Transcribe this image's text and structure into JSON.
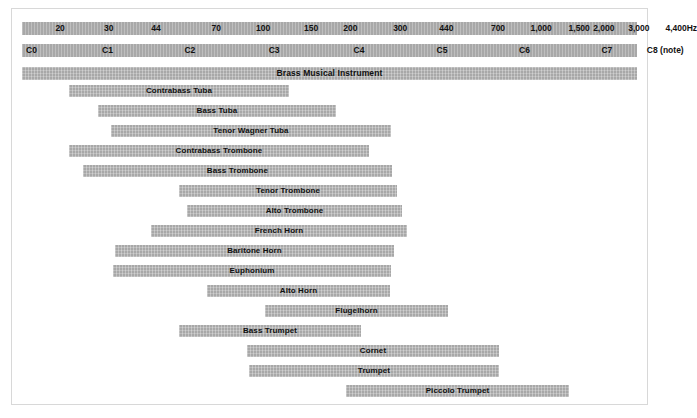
{
  "chart_data": {
    "type": "bar",
    "title": "Brass Musical Instrument",
    "subtitle": "",
    "xlabel": "",
    "ylabel": "",
    "orientation": "horizontal-range",
    "grid": false,
    "legend": "none",
    "axes": [
      {
        "name": "frequency-axis",
        "unit": "Hz",
        "scale": "logarithmic",
        "ticks": [
          {
            "label": "20",
            "x_pct": 6.2
          },
          {
            "label": "30",
            "x_pct": 14.1
          },
          {
            "label": "44",
            "x_pct": 21.8
          },
          {
            "label": "70",
            "x_pct": 31.6
          },
          {
            "label": "100",
            "x_pct": 39.2
          },
          {
            "label": "150",
            "x_pct": 47.0
          },
          {
            "label": "200",
            "x_pct": 53.4
          },
          {
            "label": "300",
            "x_pct": 61.5
          },
          {
            "label": "440",
            "x_pct": 69.0
          },
          {
            "label": "700",
            "x_pct": 77.4
          },
          {
            "label": "1,000",
            "x_pct": 84.4
          },
          {
            "label": "1,500",
            "x_pct": 90.6
          },
          {
            "label": "2,000",
            "x_pct": 94.6
          },
          {
            "label": "3,000",
            "x_pct": 100.3
          },
          {
            "label": "4,400Hz",
            "x_pct": 107.2
          }
        ]
      },
      {
        "name": "note-axis",
        "unit": "note",
        "scale": "logarithmic",
        "ticks": [
          {
            "label": "C0",
            "x_pct": 0.6,
            "anchor": "left"
          },
          {
            "label": "C1",
            "x_pct": 13.9
          },
          {
            "label": "C2",
            "x_pct": 27.3
          },
          {
            "label": "C3",
            "x_pct": 41.0
          },
          {
            "label": "C4",
            "x_pct": 54.8
          },
          {
            "label": "C5",
            "x_pct": 68.3
          },
          {
            "label": "C6",
            "x_pct": 81.7
          },
          {
            "label": "C7",
            "x_pct": 95.1
          },
          {
            "label": "C8 (note)",
            "x_pct": 104.6
          }
        ]
      }
    ],
    "master_band": {
      "label": "Brass Musical Instrument",
      "start_pct": 0,
      "end_pct": 100
    },
    "instruments": [
      {
        "name": "Contrabass Tuba",
        "start_px": 68,
        "end_px": 288
      },
      {
        "name": "Bass Tuba",
        "start_px": 97,
        "end_px": 335
      },
      {
        "name": "Tenor Wagner Tuba",
        "start_px": 110,
        "end_px": 390
      },
      {
        "name": "Contrabass Trombone",
        "start_px": 68,
        "end_px": 368
      },
      {
        "name": "Bass Trombone",
        "start_px": 82,
        "end_px": 391
      },
      {
        "name": "Tenor Trombone",
        "start_px": 178,
        "end_px": 396
      },
      {
        "name": "Alto Trombone",
        "start_px": 186,
        "end_px": 401
      },
      {
        "name": "French Horn",
        "start_px": 150,
        "end_px": 406
      },
      {
        "name": "Baritone Horn",
        "start_px": 114,
        "end_px": 393
      },
      {
        "name": "Euphonium",
        "start_px": 112,
        "end_px": 390
      },
      {
        "name": "Alto Horn",
        "start_px": 206,
        "end_px": 389
      },
      {
        "name": "Flugelhorn",
        "start_px": 264,
        "end_px": 447
      },
      {
        "name": "Bass Trumpet",
        "start_px": 178,
        "end_px": 360
      },
      {
        "name": "Cornet",
        "start_px": 246,
        "end_px": 498
      },
      {
        "name": "Trumpet",
        "start_px": 248,
        "end_px": 498
      },
      {
        "name": "Piccolo Trumpet",
        "start_px": 345,
        "end_px": 568
      }
    ],
    "colors": {
      "bar": "#a8a8a8",
      "text": "#111111",
      "background": "#ffffff",
      "frame_border": "#d8d8d8"
    },
    "row_pitch_px": 20,
    "first_row_top_px": 84,
    "bar_height_px": 12
  }
}
